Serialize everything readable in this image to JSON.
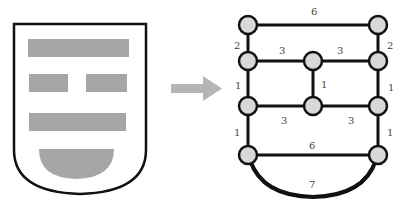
{
  "colors": {
    "outline": "#111111",
    "fill_gray": "#a6a6a6",
    "node_fill": "#d8d8d8",
    "arrow": "#b5b5b5"
  },
  "shield": {
    "blocks": [
      "top-bar",
      "middle-left-bar",
      "middle-right-bar",
      "lower-bar",
      "bottom-semicircle"
    ]
  },
  "arrow": {
    "direction": "right"
  },
  "graph": {
    "nodes": [
      {
        "id": "n1",
        "x": 248,
        "y": 25
      },
      {
        "id": "n2",
        "x": 378,
        "y": 25
      },
      {
        "id": "n3",
        "x": 248,
        "y": 61
      },
      {
        "id": "n4",
        "x": 313,
        "y": 61
      },
      {
        "id": "n5",
        "x": 378,
        "y": 61
      },
      {
        "id": "n6",
        "x": 248,
        "y": 106
      },
      {
        "id": "n7",
        "x": 313,
        "y": 106
      },
      {
        "id": "n8",
        "x": 378,
        "y": 106
      },
      {
        "id": "n9",
        "x": 248,
        "y": 155
      },
      {
        "id": "n10",
        "x": 378,
        "y": 155
      }
    ],
    "edge_labels": {
      "top": "6",
      "left_top": "2",
      "right_top": "2",
      "mid_left": "3",
      "mid_right": "3",
      "left_mid": "1",
      "center_vertical": "1",
      "right_mid": "1",
      "lower_left": "3",
      "lower_right": "3",
      "left_low": "1",
      "right_low": "1",
      "bottom": "6",
      "arc": "7"
    }
  }
}
